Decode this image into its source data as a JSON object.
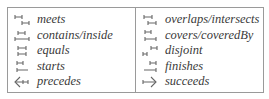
{
  "legend": {
    "left": [
      {
        "icon": "meets-icon",
        "label": "meets"
      },
      {
        "icon": "contains-inside-icon",
        "label": "contains/inside"
      },
      {
        "icon": "equals-icon",
        "label": "equals"
      },
      {
        "icon": "starts-icon",
        "label": "starts"
      },
      {
        "icon": "precedes-icon",
        "label": "precedes"
      }
    ],
    "right": [
      {
        "icon": "overlaps-intersects-icon",
        "label": "overlaps/intersects"
      },
      {
        "icon": "covers-coveredby-icon",
        "label": "covers/coveredBy"
      },
      {
        "icon": "disjoint-icon",
        "label": "disjoint"
      },
      {
        "icon": "finishes-icon",
        "label": "finishes"
      },
      {
        "icon": "succeeds-icon",
        "label": "succeeds"
      }
    ]
  }
}
